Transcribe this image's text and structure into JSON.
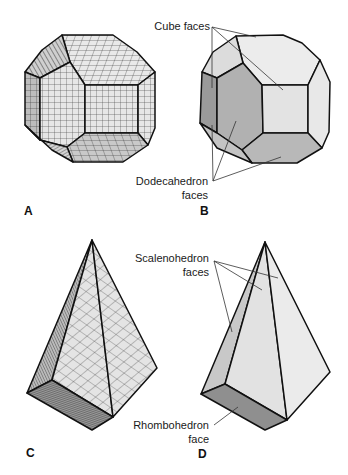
{
  "figure": {
    "panels": [
      {
        "id": "A",
        "letter": "A",
        "shape": "rhombic-truncated-cube-unit-cell-model",
        "rendering": "gridded unit-cell blocks"
      },
      {
        "id": "B",
        "letter": "B",
        "shape": "cube-dodecahedron combination",
        "rendering": "shaded faces",
        "labels": [
          {
            "text": "Cube faces"
          },
          {
            "text": "Dodecahedron",
            "text2": "faces"
          }
        ]
      },
      {
        "id": "C",
        "letter": "C",
        "shape": "scalenohedron unit-cell model",
        "rendering": "gridded unit-cell blocks"
      },
      {
        "id": "D",
        "letter": "D",
        "shape": "scalenohedron with rhombohedron face",
        "rendering": "shaded faces",
        "labels": [
          {
            "text": "Scalenohedron",
            "text2": "faces"
          },
          {
            "text": "Rhombohedron",
            "text2": "face"
          }
        ]
      }
    ],
    "colors": {
      "edge": "#111111",
      "face_light": "#ececec",
      "face_mid": "#d6d6d6",
      "face_dark": "#a9a9a9",
      "face_darker": "#8f8f8f",
      "grid_line": "#3a3a3a"
    }
  }
}
